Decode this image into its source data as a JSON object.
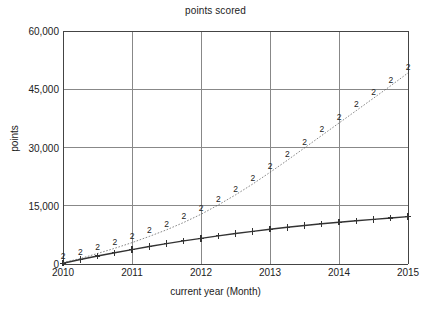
{
  "chart_data": {
    "type": "line",
    "title": "points scored",
    "xlabel": "current year (Month)",
    "ylabel": "points",
    "grid": true,
    "legend": "none",
    "xlim": [
      2010,
      2015
    ],
    "ylim": [
      0,
      60000
    ],
    "xticks": [
      "2010",
      "2011",
      "2012",
      "2013",
      "2014",
      "2015"
    ],
    "xtick_values": [
      2010,
      2011,
      2012,
      2013,
      2014,
      2015
    ],
    "yticks": [
      "0",
      "15,000",
      "30,000",
      "45,000",
      "60,000"
    ],
    "ytick_values": [
      0,
      15000,
      30000,
      45000,
      60000
    ],
    "x": [
      2010.0,
      2010.25,
      2010.5,
      2010.75,
      2011.0,
      2011.25,
      2011.5,
      2011.75,
      2012.0,
      2012.25,
      2012.5,
      2012.75,
      2013.0,
      2013.25,
      2013.5,
      2013.75,
      2014.0,
      2014.25,
      2014.5,
      2014.75,
      2015.0
    ],
    "series": [
      {
        "name": "1",
        "marker": "1",
        "linestyle": "solid",
        "color": "#333333",
        "values": [
          200,
          1150,
          2050,
          2900,
          3700,
          4500,
          5250,
          5950,
          6600,
          7250,
          7850,
          8400,
          8950,
          9450,
          9900,
          10350,
          10750,
          11150,
          11500,
          11850,
          12200
        ]
      },
      {
        "name": "2",
        "marker": "2",
        "linestyle": "dotted",
        "color": "#555555",
        "values": [
          350,
          1400,
          2700,
          4050,
          5500,
          7100,
          8800,
          10700,
          12800,
          15200,
          17800,
          20600,
          23600,
          26700,
          29900,
          33100,
          36300,
          39500,
          42700,
          45900,
          49200
        ]
      }
    ]
  },
  "plot_geometry": {
    "left": 63,
    "right": 408,
    "top": 31,
    "bottom": 264
  }
}
